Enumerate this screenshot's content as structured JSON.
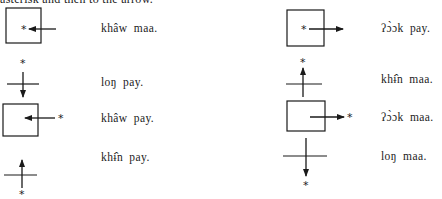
{
  "header": {
    "text": "asterisk and then to the arrow."
  },
  "items": [
    {
      "id": "L1",
      "figure": "box-arrow-in-from-right",
      "label": "khâw maa."
    },
    {
      "id": "L2",
      "figure": "cross-arrow-down-from-top",
      "label": "loŋ pay."
    },
    {
      "id": "L3",
      "figure": "box-arrow-in-toward-left",
      "label": "khâw pay."
    },
    {
      "id": "L4",
      "figure": "cross-arrow-up-from-bottom",
      "label": "khɨ̂n pay."
    },
    {
      "id": "R1",
      "figure": "box-arrow-out-to-right",
      "label": "ʔɔ̀ɔk pay."
    },
    {
      "id": "R2",
      "figure": "cross-arrow-up-to-top",
      "label": "khɨ̂n maa."
    },
    {
      "id": "R3",
      "figure": "box-arrow-out-toward-right",
      "label": "ʔɔ̀ɔk maa."
    },
    {
      "id": "R4",
      "figure": "cross-arrow-down-to-bottom",
      "label": "loŋ maa."
    }
  ],
  "colors": {
    "ink": "#1a1a1a",
    "paper": "#ffffff"
  }
}
